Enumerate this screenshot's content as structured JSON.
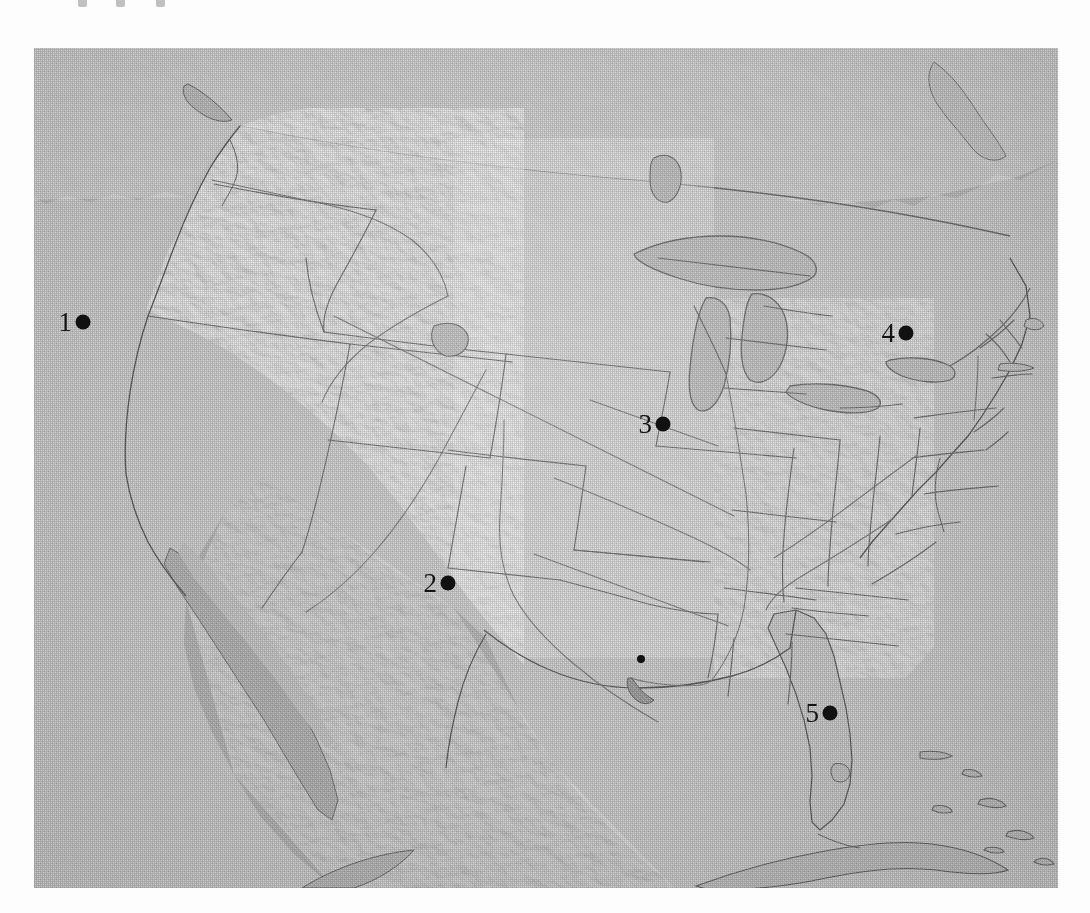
{
  "figure": {
    "kind": "map",
    "title": "",
    "frame": {
      "x": 34,
      "y": 48,
      "width": 1024,
      "height": 840
    }
  },
  "map": {
    "name": "contiguous-united-states-shaded-relief",
    "projection_look": "conic",
    "colors": {
      "ocean": "#c6c6c6",
      "us_land": "#cdcdcd",
      "foreign_land": "#b9b9b9",
      "lakes": "#c4c4c4",
      "border_line": "#6f6f6f",
      "coast_line": "#5a5a5a",
      "marker": "#111111",
      "label_text": "#141414",
      "page_background": "#fdfdfd"
    },
    "features": {
      "shows_state_borders": true,
      "shows_great_lakes": true,
      "shows_rivers": true,
      "shows_relief_shading": true,
      "neighbors_shown": [
        "Canada",
        "Mexico",
        "Cuba",
        "Bahamas",
        "Baja California"
      ]
    }
  },
  "markers": [
    {
      "id": "marker-1",
      "label": "1",
      "x": 90,
      "y": 322,
      "label_side": "left",
      "size": "large",
      "region_hint": "Northern California coast"
    },
    {
      "id": "marker-2",
      "label": "2",
      "x": 455,
      "y": 583,
      "label_side": "left",
      "size": "large",
      "region_hint": "West Texas"
    },
    {
      "id": "marker-3",
      "label": "3",
      "x": 670,
      "y": 424,
      "label_side": "left",
      "size": "large",
      "region_hint": "Indiana / Illinois"
    },
    {
      "id": "marker-4",
      "label": "4",
      "x": 913,
      "y": 333,
      "label_side": "left",
      "size": "large",
      "region_hint": "Upstate New York"
    },
    {
      "id": "marker-5",
      "label": "5",
      "x": 837,
      "y": 713,
      "label_side": "left",
      "size": "large",
      "region_hint": "Central Florida"
    },
    {
      "id": "marker-unlabeled",
      "label": "",
      "x": 641,
      "y": 659,
      "label_side": "none",
      "size": "small",
      "region_hint": "Gulf Coast, Mississippi / Louisiana"
    }
  ],
  "top_bleed_marks": [
    {
      "x": 78
    },
    {
      "x": 116
    },
    {
      "x": 156
    }
  ]
}
